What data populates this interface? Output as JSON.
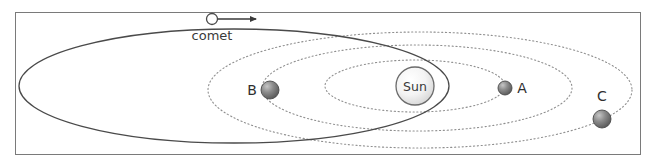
{
  "figure": {
    "background_color": "#ffffff",
    "frame": {
      "x": 15,
      "y": 12,
      "width": 626,
      "height": 143,
      "stroke": "#7a7a7a",
      "fill": "#ffffff"
    }
  },
  "sun": {
    "label": "Sun",
    "cx": 415,
    "cy": 86,
    "r": 19,
    "stroke": "#6b6b6b",
    "fill_light": "#fcfcfc",
    "fill_dark": "#d8d8d8",
    "label_color": "#3a3a3a"
  },
  "comet": {
    "label": "comet",
    "marker_cx": 212,
    "marker_cy": 19,
    "marker_r": 5.5,
    "marker_fill": "#ffffff",
    "marker_stroke": "#4a4a4a",
    "label_x": 212,
    "label_y": 40,
    "label_color": "#3a3a3a",
    "orbit": {
      "cx": 234,
      "cy": 86,
      "rx": 215,
      "ry": 57,
      "stroke": "#4a4a4a",
      "style": "solid"
    },
    "direction_arrow": {
      "from_x": 218,
      "to_x": 256,
      "y": 19,
      "color": "#3a3a3a"
    }
  },
  "planets": [
    {
      "id": "A",
      "label": "A",
      "cx": 505,
      "cy": 88,
      "r": 7,
      "fill_light": "#b4b4b4",
      "fill_dark": "#5e5e5e",
      "stroke": "#4a4a4a",
      "label_x": 522,
      "label_y": 93,
      "label_color": "#2f2f2f"
    },
    {
      "id": "B",
      "label": "B",
      "cx": 270,
      "cy": 90,
      "r": 9,
      "fill_light": "#b4b4b4",
      "fill_dark": "#5e5e5e",
      "stroke": "#4a4a4a",
      "label_x": 252,
      "label_y": 95,
      "label_color": "#2f2f2f"
    },
    {
      "id": "C",
      "label": "C",
      "cx": 602,
      "cy": 119,
      "r": 9,
      "fill_light": "#b4b4b4",
      "fill_dark": "#5e5e5e",
      "stroke": "#4a4a4a",
      "label_x": 602,
      "label_y": 101,
      "label_color": "#2f2f2f"
    }
  ],
  "orbits": [
    {
      "id": "inner-orbit",
      "belongs_to": "A",
      "cx": 415,
      "cy": 86,
      "rx": 90,
      "ry": 26,
      "stroke": "#8f8f8f",
      "style": "dotted"
    },
    {
      "id": "middle-orbit",
      "belongs_to": "B",
      "cx": 417,
      "cy": 88,
      "rx": 155,
      "ry": 43,
      "stroke": "#8f8f8f",
      "style": "dotted"
    },
    {
      "id": "outer-orbit",
      "belongs_to": "C",
      "cx": 420,
      "cy": 90,
      "rx": 212,
      "ry": 58,
      "stroke": "#8f8f8f",
      "style": "dotted"
    }
  ]
}
